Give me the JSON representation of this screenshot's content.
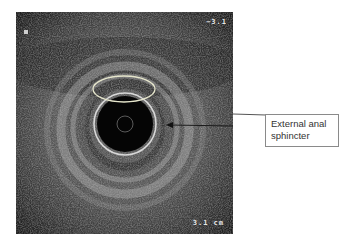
{
  "figure": {
    "image_type": "endoanal ultrasound",
    "scale_top_label": "−3.1",
    "scale_bottom_label": "3.1 cm",
    "annotation": {
      "label": "External anal\nsphincter",
      "target": "external anal sphincter ring"
    },
    "highlight_ellipse": "oval outline over anterior sphincter region",
    "colors": {
      "frame_background": "#1a1a1a",
      "ellipse_stroke": "#e6e6cc",
      "label_border": "#8a8a8a",
      "label_text": "#333333",
      "leader_line": "#555555"
    }
  }
}
